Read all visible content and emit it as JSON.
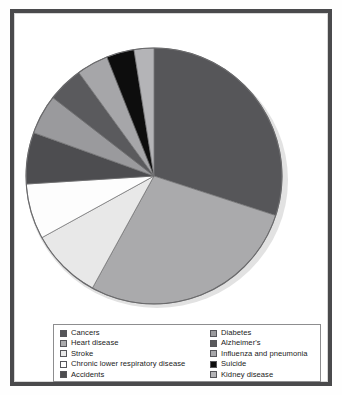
{
  "chart_data": {
    "type": "pie",
    "title": "",
    "subtitle": "",
    "xlabel": "",
    "ylabel": "",
    "grid": false,
    "legend_position": "bottom",
    "start_angle_deg": 0,
    "direction": "clockwise",
    "categories": [
      "Cancers",
      "Heart disease",
      "Stroke",
      "Chronic lower respiratory disease",
      "Accidents",
      "Diabetes",
      "Alzheimer's",
      "Influenza and pneumonia",
      "Suicide",
      "Kidney disease"
    ],
    "values": [
      30,
      28,
      9,
      7,
      6.5,
      5,
      4.5,
      4,
      3.5,
      2.5
    ],
    "colors": [
      "#565659",
      "#aaaaac",
      "#e8e8e8",
      "#fdfdfd",
      "#4d4d50",
      "#9a9a9d",
      "#5a5a5d",
      "#a6a6a9",
      "#0d0d0d",
      "#b4b4b7"
    ],
    "slices": [
      {
        "label": "Cancers",
        "value": 30,
        "color": "#565659"
      },
      {
        "label": "Heart disease",
        "value": 28,
        "color": "#aaaaac"
      },
      {
        "label": "Stroke",
        "value": 9,
        "color": "#e8e8e8"
      },
      {
        "label": "Chronic lower respiratory disease",
        "value": 7,
        "color": "#fdfdfd"
      },
      {
        "label": "Accidents",
        "value": 6.5,
        "color": "#4d4d50"
      },
      {
        "label": "Diabetes",
        "value": 5,
        "color": "#9a9a9d"
      },
      {
        "label": "Alzheimer's",
        "value": 4.5,
        "color": "#5a5a5d"
      },
      {
        "label": "Influenza and pneumonia",
        "value": 4,
        "color": "#a6a6a9"
      },
      {
        "label": "Suicide",
        "value": 3.5,
        "color": "#0d0d0d"
      },
      {
        "label": "Kidney disease",
        "value": 2.5,
        "color": "#b4b4b7"
      }
    ]
  },
  "legend": {
    "left_column": [
      {
        "label": "Cancers",
        "color": "#565659"
      },
      {
        "label": "Heart disease",
        "color": "#aaaaac"
      },
      {
        "label": "Stroke",
        "color": "#e8e8e8"
      },
      {
        "label": "Chronic lower respiratory disease",
        "color": "#fdfdfd"
      },
      {
        "label": "Accidents",
        "color": "#4d4d50"
      }
    ],
    "right_column": [
      {
        "label": "Diabetes",
        "color": "#9a9a9d"
      },
      {
        "label": "Alzheimer's",
        "color": "#5a5a5d"
      },
      {
        "label": "Influenza and pneumonia",
        "color": "#a6a6a9"
      },
      {
        "label": "Suicide",
        "color": "#0d0d0d"
      },
      {
        "label": "Kidney disease",
        "color": "#b4b4b7"
      }
    ]
  },
  "frame": {
    "border_color": "#4a4a4c",
    "background": "#ffffff"
  }
}
